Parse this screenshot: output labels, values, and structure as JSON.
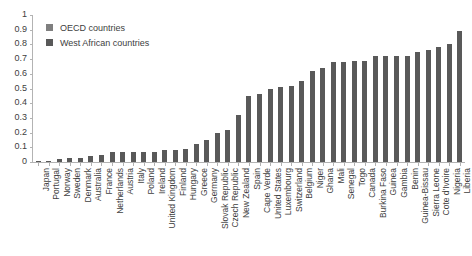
{
  "chart_data": {
    "type": "bar",
    "title": "",
    "xlabel": "",
    "ylabel": "",
    "ylim": [
      0,
      1
    ],
    "grid": false,
    "legend_position": "top-left",
    "y_ticks": [
      "0",
      "0.1",
      "0.2",
      "0.3",
      "0.4",
      "0.5",
      "0.6",
      "0.7",
      "0.8",
      "0.9",
      "1"
    ],
    "y_tick_values": [
      0,
      0.1,
      0.2,
      0.3,
      0.4,
      0.5,
      0.6,
      0.7,
      0.8,
      0.9,
      1
    ],
    "legend": [
      {
        "label": "OECD countries",
        "color": "#7f7f7f"
      },
      {
        "label": "West African countries",
        "color": "#595959"
      }
    ],
    "categories": [
      "Japan",
      "Portugal",
      "Norway",
      "Sweden",
      "Denmark",
      "Australia",
      "France",
      "Netherlands",
      "Austria",
      "Italy",
      "Poland",
      "Ireland",
      "United Kingdom",
      "Finland",
      "Hungary",
      "Greece",
      "Germany",
      "Slovak Republic",
      "Czech Republic",
      "New Zealand",
      "Spain",
      "Cape Verde",
      "United States",
      "Luxembourg",
      "Switzerland",
      "Belgium",
      "Niger",
      "Ghana",
      "Mali",
      "Senegal",
      "Togo",
      "Canada",
      "Burkina Faso",
      "Guinea",
      "Gambia",
      "Benin",
      "Guinea-Bissau",
      "Sierra Leone",
      "Cote d'Ivoire",
      "Nigeria",
      "Liberia"
    ],
    "values": [
      0.005,
      0.01,
      0.02,
      0.03,
      0.03,
      0.04,
      0.05,
      0.07,
      0.07,
      0.07,
      0.07,
      0.07,
      0.08,
      0.08,
      0.09,
      0.12,
      0.15,
      0.2,
      0.22,
      0.32,
      0.45,
      0.46,
      0.5,
      0.51,
      0.52,
      0.55,
      0.62,
      0.64,
      0.68,
      0.68,
      0.69,
      0.69,
      0.72,
      0.72,
      0.72,
      0.72,
      0.75,
      0.76,
      0.78,
      0.8,
      0.89
    ],
    "bar_color": "#595959"
  }
}
